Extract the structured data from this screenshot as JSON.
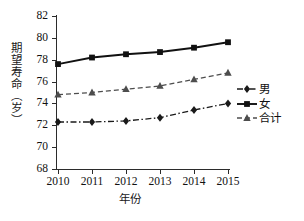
{
  "chart_data": {
    "type": "line",
    "title": "",
    "xlabel": "年份",
    "ylabel": "期望寿命（岁）",
    "categories": [
      "2010",
      "2011",
      "2012",
      "2013",
      "2014",
      "2015"
    ],
    "x": [
      2010,
      2011,
      2012,
      2013,
      2014,
      2015
    ],
    "xlim": [
      2010,
      2015
    ],
    "ylim": [
      68,
      82
    ],
    "yticks": [
      68,
      70,
      72,
      74,
      76,
      78,
      80,
      82
    ],
    "ytick_labels": [
      "68",
      "70",
      "72",
      "74",
      "76",
      "78",
      "80",
      "82"
    ],
    "grid": false,
    "legend_position": "right",
    "series": [
      {
        "name": "男",
        "values": [
          72.3,
          72.3,
          72.4,
          72.7,
          73.4,
          74.0
        ],
        "marker": "diamond",
        "linestyle": "dashdot",
        "color": "#1a1a1a"
      },
      {
        "name": "女",
        "values": [
          77.6,
          78.2,
          78.5,
          78.7,
          79.1,
          79.6
        ],
        "marker": "square",
        "linestyle": "solid",
        "color": "#111111"
      },
      {
        "name": "合计",
        "values": [
          74.8,
          75.0,
          75.3,
          75.6,
          76.2,
          76.8
        ],
        "marker": "triangle",
        "linestyle": "dashed",
        "color": "#4d4d4d"
      }
    ]
  },
  "legend": {
    "items": [
      {
        "label": "男"
      },
      {
        "label": "女"
      },
      {
        "label": "合计"
      }
    ]
  },
  "axes": {
    "y_title": "期望寿命（岁）",
    "x_title": "年份"
  }
}
